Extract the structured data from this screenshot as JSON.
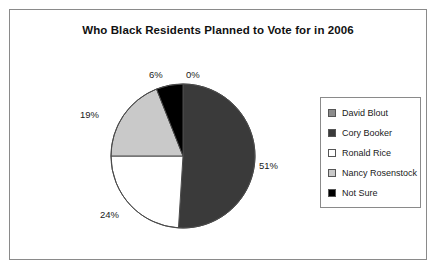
{
  "chart_data": {
    "type": "pie",
    "title": "Who Black Residents Planned to Vote for in 2006",
    "categories": [
      "David Blout",
      "Cory Booker",
      "Ronald Rice",
      "Nancy Rosenstock",
      "Not Sure"
    ],
    "values": [
      0,
      51,
      24,
      19,
      6
    ],
    "value_labels": [
      "0%",
      "51%",
      "24%",
      "19%",
      "6%"
    ],
    "slice_colors": [
      "#8c8c8c",
      "#3a3a3a",
      "#ffffff",
      "#c9c9c9",
      "#000000"
    ],
    "legend_position": "right",
    "grid": false,
    "xlabel": "",
    "ylabel": "",
    "start_angle_deg": 0,
    "direction": "clockwise",
    "slices": [
      {
        "label": "David Blout",
        "value": 0,
        "display": "0%",
        "color": "#8c8c8c"
      },
      {
        "label": "Cory Booker",
        "value": 51,
        "display": "51%",
        "color": "#3a3a3a"
      },
      {
        "label": "Ronald Rice",
        "value": 24,
        "display": "24%",
        "color": "#ffffff"
      },
      {
        "label": "Nancy Rosenstock",
        "value": 19,
        "display": "19%",
        "color": "#c9c9c9"
      },
      {
        "label": "Not Sure",
        "value": 6,
        "display": "6%",
        "color": "#000000"
      }
    ]
  },
  "labels": {
    "pct_0": "0%",
    "pct_51": "51%",
    "pct_24": "24%",
    "pct_19": "19%",
    "pct_6": "6%"
  },
  "legend": {
    "items": [
      {
        "label": "David Blout",
        "color": "#8c8c8c"
      },
      {
        "label": "Cory Booker",
        "color": "#3a3a3a"
      },
      {
        "label": "Ronald Rice",
        "color": "#ffffff"
      },
      {
        "label": "Nancy Rosenstock",
        "color": "#c9c9c9"
      },
      {
        "label": "Not Sure",
        "color": "#000000"
      }
    ]
  }
}
